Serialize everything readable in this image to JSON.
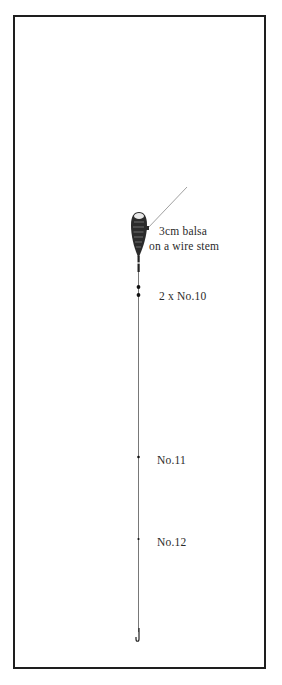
{
  "diagram": {
    "float": {
      "label_line1": "3cm balsa",
      "label_line2": "on a wire stem"
    },
    "shot": [
      {
        "label": "2 x No.10"
      },
      {
        "label": "No.11"
      },
      {
        "label": "No.12"
      }
    ],
    "colors": {
      "ink": "#1e1e1e",
      "text": "#2a2a2a",
      "background": "#ffffff"
    }
  }
}
